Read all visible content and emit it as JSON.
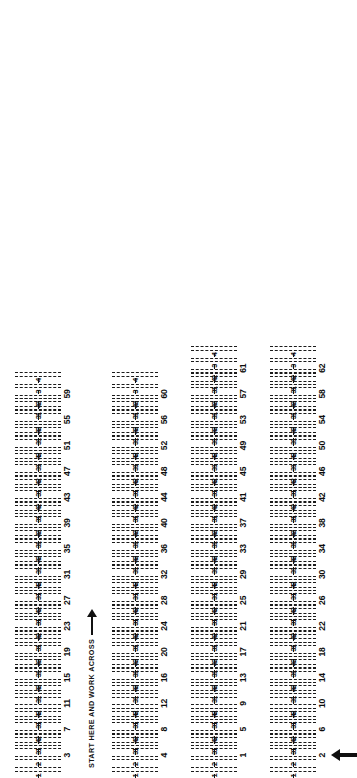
{
  "sheet": {
    "kind": "answer-sheet",
    "orientation": "rotated-90-ccw",
    "instruction": "START HERE AND WORK ACROSS",
    "start_marker": "up-arrow",
    "option_labels": [
      "1",
      "2",
      "3",
      "4"
    ],
    "ink_color": "#111111",
    "paper_color": "#ffffff"
  },
  "bands": [
    {
      "id": "band-1",
      "has_header": false,
      "has_start_arrow": false,
      "questions": [
        "3",
        "7",
        "11",
        "15",
        "19",
        "23",
        "27",
        "31",
        "35",
        "39",
        "43",
        "47",
        "51",
        "55",
        "59"
      ]
    },
    {
      "id": "band-2",
      "has_header": true,
      "header": "START HERE AND WORK ACROSS",
      "has_start_arrow": false,
      "questions": [
        "4",
        "8",
        "12",
        "16",
        "20",
        "24",
        "28",
        "32",
        "36",
        "40",
        "44",
        "48",
        "52",
        "56",
        "60"
      ]
    },
    {
      "id": "band-3",
      "has_header": false,
      "has_start_arrow": false,
      "questions": [
        "1",
        "5",
        "9",
        "13",
        "17",
        "21",
        "25",
        "29",
        "33",
        "37",
        "41",
        "45",
        "49",
        "53",
        "57",
        "61"
      ]
    },
    {
      "id": "band-4",
      "has_header": false,
      "has_start_arrow": true,
      "questions": [
        "2",
        "6",
        "10",
        "14",
        "18",
        "22",
        "26",
        "30",
        "34",
        "38",
        "42",
        "46",
        "50",
        "54",
        "58",
        "62"
      ]
    }
  ]
}
